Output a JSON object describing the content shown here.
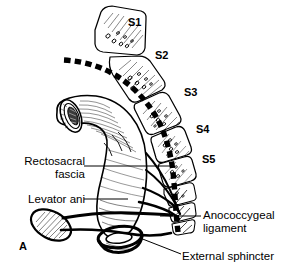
{
  "figure": {
    "panel_label": "A",
    "background_color": "#ffffff",
    "ink_color": "#000000"
  },
  "vertebra_labels": [
    {
      "text": "S1",
      "x": 128,
      "y": 16
    },
    {
      "text": "S4",
      "x": 196,
      "y": 123
    },
    {
      "text": "S2",
      "x": 155,
      "y": 49
    },
    {
      "text": "S3",
      "x": 184,
      "y": 86
    },
    {
      "text": "S5",
      "x": 202,
      "y": 153
    }
  ],
  "annotations": [
    {
      "name": "rectosacral-fascia",
      "lines": [
        "Rectosacral",
        "fascia"
      ],
      "align": "right",
      "x": 5,
      "y": 155,
      "width": 80
    },
    {
      "name": "levator-ani",
      "lines": [
        "Levator ani"
      ],
      "align": "right",
      "x": 5,
      "y": 193,
      "width": 80
    },
    {
      "name": "anococcygeal-ligament",
      "lines": [
        "Anococcygeal",
        "ligament"
      ],
      "align": "left",
      "x": 203,
      "y": 209,
      "width": 86
    },
    {
      "name": "external-sphincter",
      "lines": [
        "External sphincter"
      ],
      "align": "left",
      "x": 182,
      "y": 250,
      "width": 107
    }
  ]
}
